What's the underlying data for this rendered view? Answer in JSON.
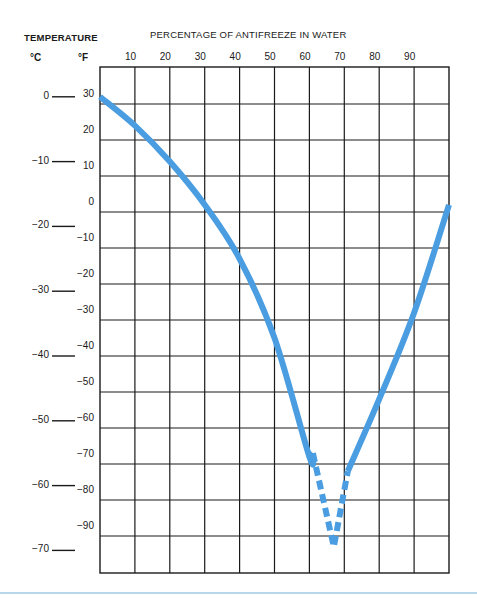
{
  "chart_data": {
    "type": "line",
    "title": "PERCENTAGE OF ANTIFREEZE IN WATER",
    "xlabel": "PERCENTAGE OF ANTIFREEZE IN WATER",
    "ylabel": "TEMPERATURE",
    "y_units": [
      "°C",
      "°F"
    ],
    "x_ticks": [
      10,
      20,
      30,
      40,
      50,
      60,
      70,
      80,
      90
    ],
    "y_ticks_f": [
      30,
      20,
      10,
      0,
      -10,
      -20,
      -30,
      -40,
      -50,
      -60,
      -70,
      -80,
      -90
    ],
    "y_ticks_c": [
      0,
      -10,
      -20,
      -30,
      -40,
      -50,
      -60,
      -70
    ],
    "xlim": [
      0,
      100
    ],
    "ylim_f": [
      -100,
      40
    ],
    "grid": true,
    "line_color": "#4a9de0",
    "series": [
      {
        "name": "Freezing point (solid)",
        "style": "solid",
        "x": [
          0,
          10,
          20,
          30,
          40,
          50,
          60,
          61
        ],
        "y_f": [
          32,
          24,
          14,
          2,
          -13,
          -35,
          -68,
          -67
        ]
      },
      {
        "name": "Freezing point (estimated, dashed)",
        "style": "dashed",
        "x": [
          61,
          67,
          71
        ],
        "y_f": [
          -67,
          -93,
          -72
        ]
      },
      {
        "name": "Freezing point (solid, high concentration)",
        "style": "solid",
        "x": [
          71,
          80,
          90,
          100
        ],
        "y_f": [
          -72,
          -52,
          -28,
          2
        ]
      }
    ]
  },
  "labels": {
    "temperature": "TEMPERATURE",
    "x_title": "PERCENTAGE OF ANTIFREEZE IN WATER",
    "unit_c": "°C",
    "unit_f": "°F"
  }
}
